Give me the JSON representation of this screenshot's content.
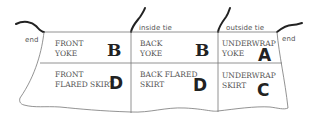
{
  "labels": {
    "end_left": "end",
    "end_right": "end",
    "inside_tie": "inside tie",
    "outside_tie": "outside tie"
  },
  "pieces": [
    {
      "line1": "FRONT",
      "line2": "YOKE",
      "letter": "B"
    },
    {
      "line1": "BACK",
      "line2": "YOKE",
      "letter": "B"
    },
    {
      "line1": "UNDERWRAP",
      "line2": "YOKE",
      "letter": "A"
    },
    {
      "line1": "FRONT",
      "line2": "FLARED SKIRT",
      "letter": "D"
    },
    {
      "line1": "BACK FLARED",
      "line2": "SKIRT",
      "letter": "D"
    },
    {
      "line1": "UNDERWRAP",
      "line2": "SKIRT",
      "letter": "C"
    }
  ],
  "colors": {
    "line": "#777777",
    "tie": "#222222",
    "text": "#555555",
    "letter": "#222222"
  }
}
